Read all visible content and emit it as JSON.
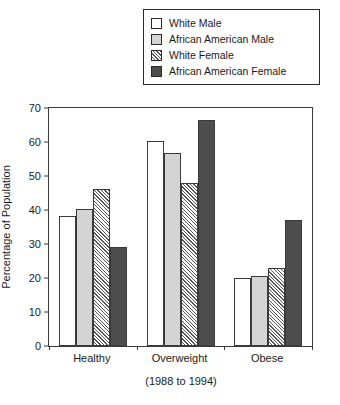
{
  "chart_data": {
    "type": "bar",
    "title": "",
    "xlabel": "(1988 to 1994)",
    "ylabel": "Percentage of Population",
    "categories": [
      "Healthy",
      "Overweight",
      "Obese"
    ],
    "series": [
      {
        "name": "White Male",
        "style": "white",
        "color": "#ffffff",
        "values": [
          38.3,
          60.3,
          20.0
        ]
      },
      {
        "name": "African American Male",
        "style": "lgray",
        "color": "#d4d4d4",
        "values": [
          40.2,
          56.7,
          20.5
        ]
      },
      {
        "name": "White Female",
        "style": "hatch",
        "color": "#ffffff",
        "values": [
          46.2,
          47.8,
          23.0
        ]
      },
      {
        "name": "African American Female",
        "style": "dgray",
        "color": "#4d4d4d",
        "values": [
          29.0,
          66.4,
          37.2
        ]
      }
    ],
    "ylim": [
      0,
      70
    ],
    "yticks": [
      0,
      10,
      20,
      30,
      40,
      50,
      60,
      70
    ],
    "grid": false,
    "legend_position": "top"
  }
}
